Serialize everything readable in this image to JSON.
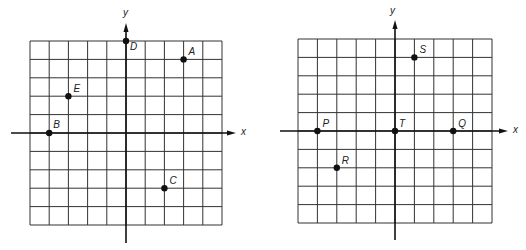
{
  "colors": {
    "grid": "#333333",
    "axis": "#111111",
    "point": "#111111",
    "background": "#ffffff"
  },
  "plots": [
    {
      "name": "left-plane",
      "grid": {
        "x0": 30,
        "y0": 41,
        "x1": 222,
        "y1": 225,
        "cols": 10,
        "rows": 10
      },
      "range": {
        "xmin": -5,
        "xmax": 5,
        "ymin": -5,
        "ymax": 5
      },
      "axes": {
        "x_label": "x",
        "y_label": "y",
        "x_axis_start": 11,
        "x_axis_end": 236,
        "y_axis_top": 23,
        "y_axis_bottom": 243,
        "x_label_pos": [
          241,
          135
        ],
        "y_label_pos": [
          123,
          16
        ]
      },
      "points": [
        {
          "label": "A",
          "x": 3,
          "y": 4,
          "label_dx": 5,
          "label_dy": -4
        },
        {
          "label": "B",
          "x": -4,
          "y": 0,
          "label_dx": 4,
          "label_dy": -5
        },
        {
          "label": "C",
          "x": 2,
          "y": -3,
          "label_dx": 5,
          "label_dy": -4
        },
        {
          "label": "D",
          "x": 0,
          "y": 5,
          "label_dx": 4,
          "label_dy": 9
        },
        {
          "label": "E",
          "x": -3,
          "y": 2,
          "label_dx": 5,
          "label_dy": -4
        }
      ]
    },
    {
      "name": "right-plane",
      "grid": {
        "x0": 298,
        "y0": 39,
        "x1": 492,
        "y1": 223,
        "cols": 10,
        "rows": 10
      },
      "range": {
        "xmin": -5,
        "xmax": 5,
        "ymin": -5,
        "ymax": 5
      },
      "axes": {
        "x_label": "x",
        "y_label": "y",
        "x_axis_start": 280,
        "x_axis_end": 508,
        "y_axis_top": 20,
        "y_axis_bottom": 240,
        "x_label_pos": [
          513,
          133
        ],
        "y_label_pos": [
          390,
          14
        ]
      },
      "points": [
        {
          "label": "P",
          "x": -4,
          "y": 0,
          "label_dx": 5,
          "label_dy": -4
        },
        {
          "label": "Q",
          "x": 3,
          "y": 0,
          "label_dx": 5,
          "label_dy": -4
        },
        {
          "label": "R",
          "x": -3,
          "y": -2,
          "label_dx": 5,
          "label_dy": -4
        },
        {
          "label": "S",
          "x": 1,
          "y": 4,
          "label_dx": 5,
          "label_dy": -4
        },
        {
          "label": "T",
          "x": 0,
          "y": 0,
          "label_dx": 4,
          "label_dy": -4
        }
      ]
    }
  ]
}
